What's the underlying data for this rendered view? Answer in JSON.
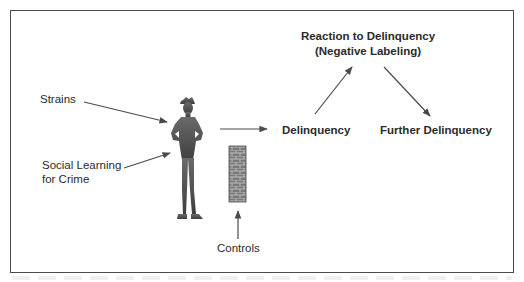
{
  "diagram": {
    "type": "flow",
    "colors": {
      "frame": "#4a4a4a",
      "arrow": "#4a4a4a",
      "text": "#2b2b2b",
      "figure": "#555555",
      "wall": "#6a6a6a"
    },
    "nodes": {
      "strains": "Strains",
      "social_learning_line1": "Social Learning",
      "social_learning_line2": "for Crime",
      "controls": "Controls",
      "delinquency": "Delinquency",
      "reaction_line1": "Reaction to Delinquency",
      "reaction_line2": "(Negative Labeling)",
      "further_delinquency": "Further Delinquency"
    },
    "icons": {
      "person": "person-silhouette-icon",
      "wall": "brick-wall-icon"
    },
    "edges": [
      {
        "from": "Strains",
        "to": "person"
      },
      {
        "from": "Social Learning for Crime",
        "to": "person"
      },
      {
        "from": "Controls",
        "to": "wall"
      },
      {
        "from": "person",
        "to": "Delinquency"
      },
      {
        "from": "Delinquency",
        "to": "Reaction to Delinquency (Negative Labeling)"
      },
      {
        "from": "Reaction to Delinquency (Negative Labeling)",
        "to": "Further Delinquency"
      }
    ]
  }
}
